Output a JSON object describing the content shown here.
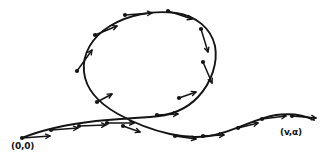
{
  "figure": {
    "kind": "hand-drawn-sketch",
    "background_color": "#ffffff",
    "ink_color": "#141414"
  },
  "labels": {
    "start_point": "(0,0)",
    "end_point": "(v,α)"
  },
  "curve": {
    "name": "looping-trajectory",
    "stroke_color": "#141414",
    "stroke_width": 1.9,
    "path": "M 22 138 C 44 129, 70 124, 96 121 C 118 119, 134 118, 150 117 C 168 116, 186 110, 198 97 C 212 82, 218 62, 215 46 C 211 28, 196 16, 176 13 C 152 10, 128 15, 110 26 C 92 37, 82 54, 84 72 C 86 90, 100 104, 118 114 C 134 123, 152 130, 170 134 C 188 138, 206 138, 222 133 C 242 127, 258 118, 276 115 C 292 113, 304 115, 314 120"
  },
  "vectors": [
    {
      "name": "vector-start",
      "x1": 22,
      "y1": 138,
      "x2": 50,
      "y2": 136
    },
    {
      "name": "vector-lower-left-1",
      "x1": 51,
      "y1": 130,
      "x2": 78,
      "y2": 128
    },
    {
      "name": "vector-lower-left-2",
      "x1": 79,
      "y1": 126,
      "x2": 106,
      "y2": 125
    },
    {
      "name": "vector-lower-mid",
      "x1": 107,
      "y1": 123,
      "x2": 134,
      "y2": 123
    },
    {
      "name": "vector-crossing-lower",
      "x1": 123,
      "y1": 126,
      "x2": 140,
      "y2": 132
    },
    {
      "name": "vector-loop-left-lower",
      "x1": 97,
      "y1": 102,
      "x2": 112,
      "y2": 94
    },
    {
      "name": "vector-loop-left-long",
      "x1": 77,
      "y1": 71,
      "x2": 92,
      "y2": 50
    },
    {
      "name": "vector-loop-upper-left",
      "x1": 95,
      "y1": 35,
      "x2": 117,
      "y2": 26
    },
    {
      "name": "vector-loop-top-left",
      "x1": 125,
      "y1": 15,
      "x2": 152,
      "y2": 13
    },
    {
      "name": "vector-loop-top-right",
      "x1": 168,
      "y1": 11,
      "x2": 192,
      "y2": 19
    },
    {
      "name": "vector-loop-right-upper",
      "x1": 201,
      "y1": 29,
      "x2": 208,
      "y2": 52
    },
    {
      "name": "vector-loop-right-mid",
      "x1": 203,
      "y1": 62,
      "x2": 212,
      "y2": 83
    },
    {
      "name": "vector-loop-right-lower",
      "x1": 179,
      "y1": 98,
      "x2": 196,
      "y2": 92
    },
    {
      "name": "vector-descending",
      "x1": 157,
      "y1": 115,
      "x2": 178,
      "y2": 114
    },
    {
      "name": "vector-bottom-trough-1",
      "x1": 175,
      "y1": 136,
      "x2": 196,
      "y2": 139
    },
    {
      "name": "vector-bottom-trough-2",
      "x1": 203,
      "y1": 136,
      "x2": 224,
      "y2": 135
    },
    {
      "name": "vector-rising-right",
      "x1": 238,
      "y1": 128,
      "x2": 258,
      "y2": 123
    },
    {
      "name": "vector-right-upper",
      "x1": 262,
      "y1": 119,
      "x2": 286,
      "y2": 116
    },
    {
      "name": "vector-end",
      "x1": 292,
      "y1": 116,
      "x2": 316,
      "y2": 118
    }
  ]
}
